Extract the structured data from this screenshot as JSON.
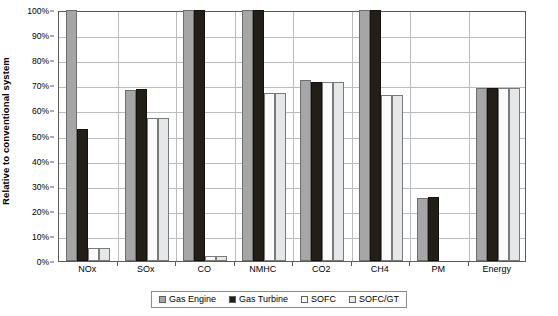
{
  "chart_data": {
    "type": "bar",
    "title": "",
    "xlabel": "",
    "ylabel": "Relative to conventional system",
    "ylim": [
      0,
      100
    ],
    "ytick_labels": [
      "0%",
      "10%",
      "20%",
      "30%",
      "40%",
      "50%",
      "60%",
      "70%",
      "80%",
      "90%",
      "100%"
    ],
    "ytick_values": [
      0,
      10,
      20,
      30,
      40,
      50,
      60,
      70,
      80,
      90,
      100
    ],
    "grid": true,
    "legend_position": "bottom-center",
    "categories": [
      "NOx",
      "SOx",
      "CO",
      "NMHC",
      "CO2",
      "CH4",
      "PM",
      "Energy"
    ],
    "series": [
      {
        "name": "Gas Engine",
        "color": "#a6a6a6",
        "values": [
          100,
          68,
          100,
          100,
          72,
          100,
          25,
          69
        ]
      },
      {
        "name": "Gas Turbine",
        "color": "#231f18",
        "values": [
          52.5,
          68.5,
          100,
          100,
          71.5,
          100,
          25.5,
          69
        ]
      },
      {
        "name": "SOFC",
        "color": "#fbfbfb",
        "values": [
          5,
          57,
          2,
          67,
          71.5,
          66,
          0,
          69
        ]
      },
      {
        "name": "SOFC/GT",
        "color": "#e6e7e9",
        "values": [
          5,
          57,
          2,
          67,
          71.5,
          66,
          0,
          69
        ]
      }
    ]
  },
  "legend": {
    "items": [
      {
        "label": "Gas Engine"
      },
      {
        "label": "Gas Turbine"
      },
      {
        "label": "SOFC"
      },
      {
        "label": "SOFC/GT"
      }
    ]
  }
}
